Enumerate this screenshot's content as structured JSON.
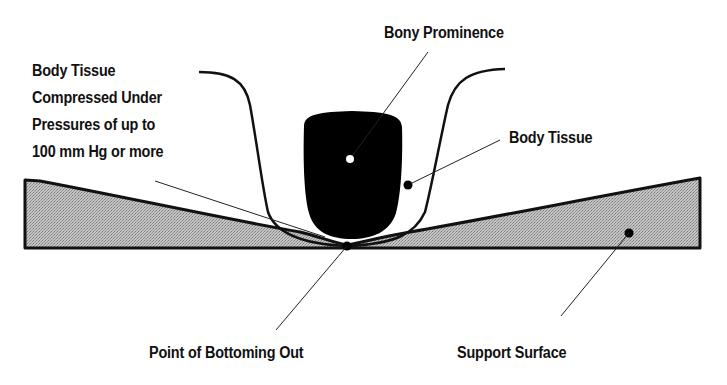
{
  "diagram": {
    "labels": {
      "bony_prominence": "Bony Prominence",
      "body_tissue": "Body Tissue",
      "compressed_tissue": "Body Tissue\nCompressed Under\nPressures of up to\n100 mm Hg or more",
      "point_of_bottoming_out": "Point of Bottoming Out",
      "support_surface": "Support Surface"
    },
    "colors": {
      "bone": "#000000",
      "support_fill": "#b8b8b8",
      "outline": "#111111",
      "background": "#ffffff"
    }
  }
}
